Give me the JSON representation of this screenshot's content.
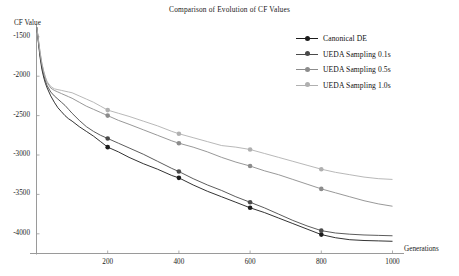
{
  "chart_data": {
    "type": "line",
    "title": "Comparison of Evolution of CF Values",
    "xlabel": "Generations",
    "ylabel": "CF Value",
    "xlim": [
      0,
      1000
    ],
    "ylim": [
      -4250,
      -1350
    ],
    "xticks": [
      200,
      400,
      600,
      800,
      1000
    ],
    "yticks": [
      -1500,
      -2000,
      -2500,
      -3000,
      -3500,
      -4000
    ],
    "grid": false,
    "legend_position": "upper right",
    "marker_generations": [
      200,
      400,
      600,
      800
    ],
    "series": [
      {
        "name": "Canonical DE",
        "color": "#1c1c1c",
        "marker": "circle",
        "x": [
          1,
          5,
          10,
          15,
          20,
          25,
          30,
          40,
          50,
          60,
          70,
          80,
          90,
          100,
          120,
          140,
          160,
          180,
          200,
          230,
          260,
          300,
          340,
          380,
          400,
          440,
          480,
          520,
          560,
          600,
          640,
          680,
          720,
          760,
          800,
          840,
          880,
          920,
          960,
          1000
        ],
        "y": [
          -1380,
          -1560,
          -1760,
          -1910,
          -2010,
          -2090,
          -2150,
          -2250,
          -2330,
          -2400,
          -2450,
          -2500,
          -2540,
          -2570,
          -2640,
          -2700,
          -2760,
          -2830,
          -2900,
          -2960,
          -3030,
          -3110,
          -3180,
          -3260,
          -3290,
          -3380,
          -3460,
          -3530,
          -3600,
          -3670,
          -3730,
          -3800,
          -3870,
          -3940,
          -4010,
          -4050,
          -4075,
          -4085,
          -4090,
          -4095
        ]
      },
      {
        "name": "UEDA Sampling 0.1s",
        "color": "#4a4a4a",
        "marker": "circle",
        "x": [
          1,
          5,
          10,
          15,
          20,
          25,
          30,
          40,
          50,
          60,
          70,
          80,
          90,
          100,
          120,
          140,
          160,
          180,
          200,
          230,
          260,
          300,
          340,
          380,
          400,
          440,
          480,
          520,
          560,
          600,
          640,
          680,
          720,
          760,
          800,
          840,
          880,
          920,
          960,
          1000
        ],
        "y": [
          -1380,
          -1545,
          -1730,
          -1870,
          -1980,
          -2060,
          -2120,
          -2200,
          -2250,
          -2290,
          -2330,
          -2370,
          -2420,
          -2470,
          -2560,
          -2640,
          -2700,
          -2750,
          -2790,
          -2850,
          -2910,
          -2990,
          -3080,
          -3170,
          -3210,
          -3300,
          -3380,
          -3450,
          -3530,
          -3600,
          -3670,
          -3750,
          -3830,
          -3900,
          -3960,
          -3990,
          -4005,
          -4015,
          -4020,
          -4025
        ]
      },
      {
        "name": "UEDA Sampling 0.5s",
        "color": "#8c8c8c",
        "marker": "circle",
        "x": [
          1,
          5,
          10,
          15,
          20,
          25,
          30,
          40,
          50,
          60,
          70,
          80,
          90,
          100,
          120,
          140,
          160,
          180,
          200,
          230,
          260,
          300,
          340,
          380,
          400,
          440,
          480,
          520,
          560,
          600,
          640,
          680,
          720,
          760,
          800,
          840,
          880,
          920,
          960,
          1000
        ],
        "y": [
          -1380,
          -1530,
          -1700,
          -1840,
          -1940,
          -2020,
          -2080,
          -2150,
          -2180,
          -2200,
          -2220,
          -2240,
          -2260,
          -2280,
          -2330,
          -2380,
          -2420,
          -2460,
          -2500,
          -2560,
          -2610,
          -2680,
          -2750,
          -2820,
          -2850,
          -2900,
          -2960,
          -3030,
          -3090,
          -3140,
          -3200,
          -3250,
          -3310,
          -3370,
          -3430,
          -3480,
          -3530,
          -3580,
          -3620,
          -3650
        ]
      },
      {
        "name": "UEDA Sampling 1.0s",
        "color": "#b0b0b0",
        "marker": "circle",
        "x": [
          1,
          5,
          10,
          15,
          20,
          25,
          30,
          40,
          50,
          60,
          70,
          80,
          90,
          100,
          120,
          140,
          160,
          180,
          200,
          230,
          260,
          300,
          340,
          380,
          400,
          440,
          480,
          520,
          560,
          600,
          640,
          680,
          720,
          760,
          800,
          840,
          880,
          920,
          960,
          1000
        ],
        "y": [
          -1380,
          -1520,
          -1690,
          -1830,
          -1930,
          -2010,
          -2070,
          -2130,
          -2160,
          -2170,
          -2180,
          -2190,
          -2200,
          -2210,
          -2250,
          -2290,
          -2330,
          -2380,
          -2430,
          -2470,
          -2510,
          -2570,
          -2630,
          -2700,
          -2730,
          -2780,
          -2830,
          -2880,
          -2900,
          -2930,
          -2980,
          -3030,
          -3080,
          -3130,
          -3180,
          -3220,
          -3250,
          -3280,
          -3300,
          -3310
        ]
      }
    ]
  },
  "legend": {
    "items": [
      {
        "label": "Canonical DE"
      },
      {
        "label": "UEDA Sampling 0.1s"
      },
      {
        "label": "UEDA Sampling 0.5s"
      },
      {
        "label": "UEDA Sampling 1.0s"
      }
    ]
  },
  "axes": {
    "y_tick_labels": [
      "-1500",
      "-2000",
      "-2500",
      "-3000",
      "-3500",
      "-4000"
    ],
    "x_tick_labels": [
      "200",
      "400",
      "600",
      "800",
      "1000"
    ]
  }
}
